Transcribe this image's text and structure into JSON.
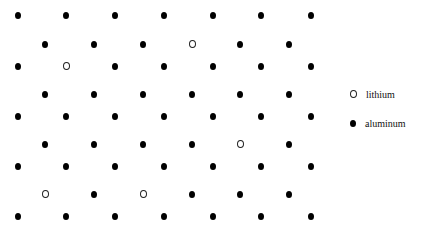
{
  "figure": {
    "colors": {
      "aluminum_fill": "#000000",
      "lithium_stroke": "#222222",
      "lithium_fill": "#ffffff",
      "background": "#ffffff"
    },
    "rows": [
      {
        "y": 15,
        "x": [
          18,
          66,
          115,
          164,
          213,
          261,
          311
        ],
        "types": [
          "al",
          "al",
          "al",
          "al",
          "al",
          "al",
          "al"
        ]
      },
      {
        "y": 44,
        "x": [
          45,
          94,
          143,
          192,
          240,
          289
        ],
        "types": [
          "al",
          "al",
          "al",
          "li",
          "al",
          "al"
        ]
      },
      {
        "y": 66,
        "x": [
          18,
          66,
          115,
          164,
          213,
          261,
          311
        ],
        "types": [
          "al",
          "li",
          "al",
          "al",
          "al",
          "al",
          "al"
        ]
      },
      {
        "y": 94,
        "x": [
          45,
          94,
          143,
          192,
          240,
          289
        ],
        "types": [
          "al",
          "al",
          "al",
          "al",
          "al",
          "al"
        ]
      },
      {
        "y": 116,
        "x": [
          18,
          66,
          115,
          164,
          213,
          261,
          311
        ],
        "types": [
          "al",
          "al",
          "al",
          "al",
          "al",
          "al",
          "al"
        ]
      },
      {
        "y": 144,
        "x": [
          45,
          94,
          143,
          192,
          240,
          289
        ],
        "types": [
          "al",
          "al",
          "al",
          "al",
          "li",
          "al"
        ]
      },
      {
        "y": 166,
        "x": [
          18,
          66,
          115,
          164,
          213,
          261,
          311
        ],
        "types": [
          "al",
          "al",
          "al",
          "al",
          "al",
          "al",
          "al"
        ]
      },
      {
        "y": 194,
        "x": [
          45,
          94,
          143,
          192,
          240,
          289
        ],
        "types": [
          "li",
          "al",
          "li",
          "al",
          "al",
          "al"
        ]
      },
      {
        "y": 216,
        "x": [
          18,
          66,
          115,
          164,
          213,
          261,
          311
        ],
        "types": [
          "al",
          "al",
          "al",
          "al",
          "al",
          "al",
          "al"
        ]
      }
    ]
  },
  "legend": {
    "items": [
      {
        "key": "li",
        "label": "lithium",
        "symbol": "open-circle"
      },
      {
        "key": "al",
        "label": "aluminum",
        "symbol": "filled-circle"
      }
    ]
  }
}
